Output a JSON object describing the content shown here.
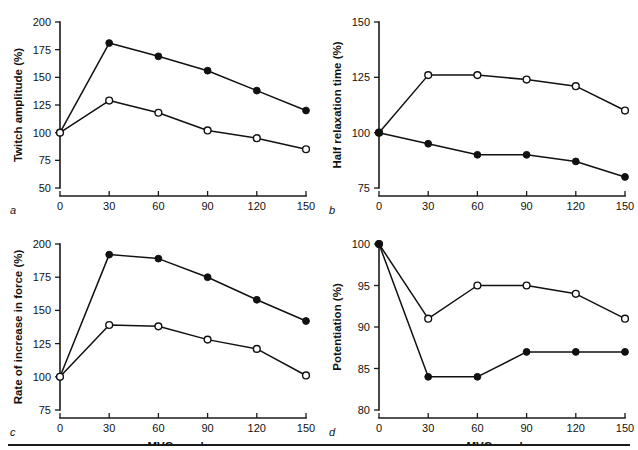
{
  "figure": {
    "bottom_rule": true,
    "shared_xlabel": "MVC number",
    "x_categories": [
      0,
      30,
      60,
      90,
      120,
      150
    ]
  },
  "chart_data": [
    {
      "id": "a",
      "type": "line",
      "panel_letter": "a",
      "title": "",
      "xlabel": "",
      "ylabel": "Twitch amplitude (%)",
      "x": [
        0,
        30,
        60,
        90,
        120,
        150
      ],
      "xlim": [
        0,
        150
      ],
      "ylim": [
        50,
        200
      ],
      "xticks": [
        0,
        30,
        60,
        90,
        120,
        150
      ],
      "yticks": [
        50,
        75,
        100,
        125,
        150,
        175,
        200
      ],
      "grid": false,
      "legend": "none",
      "series": [
        {
          "name": "filled-circle-series",
          "marker": "filled-circle",
          "values": [
            100,
            181,
            169,
            156,
            138,
            120
          ]
        },
        {
          "name": "open-circle-series",
          "marker": "open-circle",
          "values": [
            100,
            129,
            118,
            102,
            95,
            85
          ]
        }
      ]
    },
    {
      "id": "b",
      "type": "line",
      "panel_letter": "b",
      "title": "",
      "xlabel": "",
      "ylabel": "Half relaxation time (%)",
      "x": [
        0,
        30,
        60,
        90,
        120,
        150
      ],
      "xlim": [
        0,
        150
      ],
      "ylim": [
        75,
        150
      ],
      "xticks": [
        0,
        30,
        60,
        90,
        120,
        150
      ],
      "yticks": [
        75,
        100,
        125,
        150
      ],
      "grid": false,
      "legend": "none",
      "series": [
        {
          "name": "open-circle-series",
          "marker": "open-circle",
          "values": [
            100,
            126,
            126,
            124,
            121,
            110
          ]
        },
        {
          "name": "filled-circle-series",
          "marker": "filled-circle",
          "values": [
            100,
            95,
            90,
            90,
            87,
            80
          ]
        }
      ]
    },
    {
      "id": "c",
      "type": "line",
      "panel_letter": "c",
      "title": "",
      "xlabel": "MVC number",
      "ylabel": "Rate of increase in force (%)",
      "x": [
        0,
        30,
        60,
        90,
        120,
        150
      ],
      "xlim": [
        0,
        150
      ],
      "ylim": [
        75,
        200
      ],
      "xticks": [
        0,
        30,
        60,
        90,
        120,
        150
      ],
      "yticks": [
        75,
        100,
        125,
        150,
        175,
        200
      ],
      "grid": false,
      "legend": "none",
      "series": [
        {
          "name": "filled-circle-series",
          "marker": "filled-circle",
          "values": [
            100,
            192,
            189,
            175,
            158,
            142
          ]
        },
        {
          "name": "open-circle-series",
          "marker": "open-circle",
          "values": [
            100,
            139,
            138,
            128,
            121,
            101
          ]
        }
      ]
    },
    {
      "id": "d",
      "type": "line",
      "panel_letter": "d",
      "title": "",
      "xlabel": "MVC number",
      "ylabel": "Potentiation (%)",
      "x": [
        0,
        30,
        60,
        90,
        120,
        150
      ],
      "xlim": [
        0,
        150
      ],
      "ylim": [
        80,
        100
      ],
      "xticks": [
        0,
        30,
        60,
        90,
        120,
        150
      ],
      "yticks": [
        80,
        85,
        90,
        95,
        100
      ],
      "grid": false,
      "legend": "none",
      "series": [
        {
          "name": "open-circle-series",
          "marker": "open-circle",
          "values": [
            100,
            91,
            95,
            95,
            94,
            91
          ]
        },
        {
          "name": "filled-circle-series",
          "marker": "filled-circle",
          "values": [
            100,
            84,
            84,
            87,
            87,
            87
          ]
        }
      ]
    }
  ]
}
